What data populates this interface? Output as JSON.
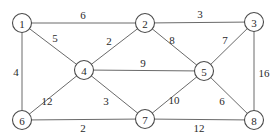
{
  "diagram": {
    "type": "weighted-undirected-graph",
    "nodes": [
      {
        "id": "1",
        "label": "1"
      },
      {
        "id": "2",
        "label": "2"
      },
      {
        "id": "3",
        "label": "3"
      },
      {
        "id": "4",
        "label": "4"
      },
      {
        "id": "5",
        "label": "5"
      },
      {
        "id": "6",
        "label": "6"
      },
      {
        "id": "7",
        "label": "7"
      },
      {
        "id": "8",
        "label": "8"
      }
    ],
    "edges": [
      {
        "from": "1",
        "to": "2",
        "weight": "6"
      },
      {
        "from": "2",
        "to": "3",
        "weight": "3"
      },
      {
        "from": "1",
        "to": "4",
        "weight": "5"
      },
      {
        "from": "2",
        "to": "4",
        "weight": "2"
      },
      {
        "from": "2",
        "to": "5",
        "weight": "8"
      },
      {
        "from": "3",
        "to": "5",
        "weight": "7"
      },
      {
        "from": "1",
        "to": "6",
        "weight": "4"
      },
      {
        "from": "4",
        "to": "5",
        "weight": "9"
      },
      {
        "from": "3",
        "to": "8",
        "weight": "16"
      },
      {
        "from": "4",
        "to": "6",
        "weight": "12"
      },
      {
        "from": "4",
        "to": "7",
        "weight": "3"
      },
      {
        "from": "5",
        "to": "7",
        "weight": "10"
      },
      {
        "from": "5",
        "to": "8",
        "weight": "6"
      },
      {
        "from": "6",
        "to": "7",
        "weight": "2"
      },
      {
        "from": "7",
        "to": "8",
        "weight": "12"
      }
    ]
  }
}
